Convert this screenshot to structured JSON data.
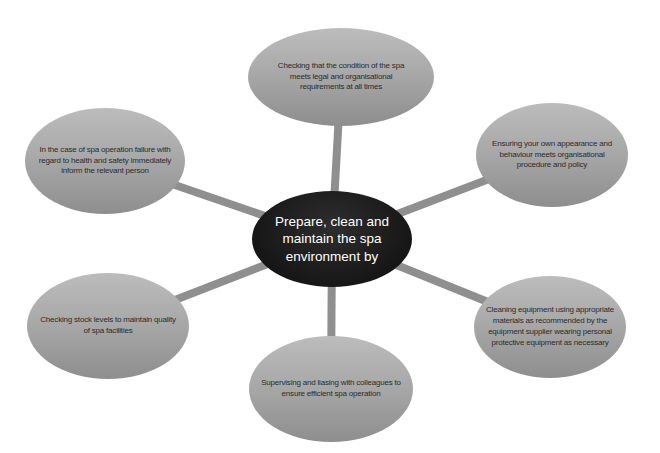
{
  "diagram": {
    "center": {
      "text": "Prepare, clean and\nmaintain the spa\nenvironment by"
    },
    "nodes": [
      {
        "id": "top",
        "text": "Checking that the condition of the spa\nmeets legal and organisational\nrequirements at all times"
      },
      {
        "id": "top-right",
        "text": "Ensuring your own appearance and\nbehaviour meets organisational\nprocedure and policy"
      },
      {
        "id": "bottom-right",
        "text": "Cleaning equipment using appropriate\nmaterials as recommended by the\nequipment supplier wearing personal\nprotective equipment as necessary"
      },
      {
        "id": "bottom",
        "text": "Supervising and liasing with colleagues to\nensure efficient spa operation"
      },
      {
        "id": "bottom-left",
        "text": "Checking stock levels to maintain quality\nof spa facilities"
      },
      {
        "id": "top-left",
        "text": "In the case of spa operation failure with\nregard to health and safety immediately\ninform the relevant person"
      }
    ],
    "colors": {
      "background": "#ffffff",
      "connector": "#8f8f8f",
      "satellite_fill_top": "#bcbcbc",
      "satellite_fill_bottom": "#8e8e8e",
      "satellite_text": "#2b2b2b",
      "hub_fill": "#181818",
      "hub_text": "#ffffff"
    }
  }
}
